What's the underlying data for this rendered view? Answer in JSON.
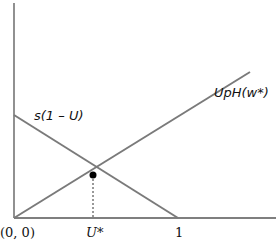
{
  "diagram": {
    "curves": [
      {
        "id": "flow-in",
        "label": "s(1 – U)",
        "direction": "decreasing",
        "color": "#7a7a7a"
      },
      {
        "id": "flow-out",
        "label": "UpH(w*)",
        "direction": "increasing",
        "color": "#7a7a7a"
      }
    ],
    "axes": {
      "origin_label": "(0, 0)",
      "x_ticks": [
        {
          "label": "U*",
          "position": "equilibrium"
        },
        {
          "label": "1",
          "position": "x-intercept of s(1 – U)"
        }
      ],
      "color": "#555555"
    },
    "equilibrium": {
      "label": "U*",
      "marker": "filled-dot"
    }
  }
}
